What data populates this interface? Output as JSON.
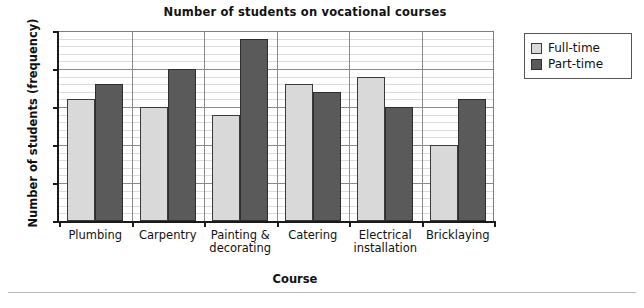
{
  "chart_data": {
    "type": "bar",
    "title": "Number of students on vocational courses",
    "xlabel": "Course",
    "ylabel": "Number of students (frequency)",
    "categories": [
      "Plumbing",
      "Carpentry",
      "Painting &\ndecorating",
      "Catering",
      "Electrical\ninstallation",
      "Bricklaying"
    ],
    "category_lines": [
      [
        "Plumbing"
      ],
      [
        "Carpentry"
      ],
      [
        "Painting &",
        "decorating"
      ],
      [
        "Catering"
      ],
      [
        "Electrical",
        "installation"
      ],
      [
        "Bricklaying"
      ]
    ],
    "series": [
      {
        "name": "Full-time",
        "color": "#d9d9d9",
        "values": [
          16,
          15,
          14,
          18,
          19,
          10
        ]
      },
      {
        "name": "Part-time",
        "color": "#5a5a5a",
        "values": [
          18,
          20,
          24,
          17,
          15,
          16
        ]
      }
    ],
    "ylim": [
      0,
      25
    ],
    "ytick_labels": [
      "0",
      "5",
      "10",
      "15",
      "20",
      "25"
    ],
    "ytick_values": [
      0,
      5,
      10,
      15,
      20,
      25
    ],
    "y_minor_step": 1,
    "grid": "horizontal major and minor, vertical group separators",
    "legend_position": "right, outside plot area"
  },
  "legend": {
    "items": [
      {
        "label": "Full-time",
        "swatch": "full"
      },
      {
        "label": "Part-time",
        "swatch": "part"
      }
    ]
  }
}
